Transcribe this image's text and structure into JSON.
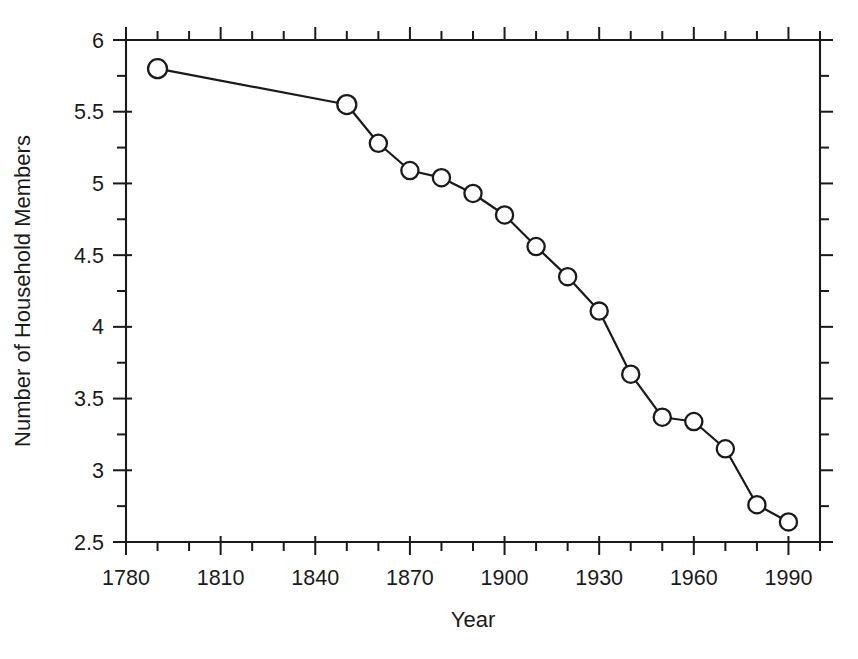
{
  "chart_data": {
    "type": "line",
    "title": "",
    "subtitle": "",
    "xlabel": "Year",
    "ylabel": "Number of Household Members",
    "xlim": [
      1780,
      2000
    ],
    "ylim": [
      2.5,
      6
    ],
    "x_major_ticks": [
      1780,
      1810,
      1840,
      1870,
      1900,
      1930,
      1960,
      1990
    ],
    "x_major_tick_labels": [
      "1780",
      "1810",
      "1840",
      "1870",
      "1900",
      "1930",
      "1960",
      "1990"
    ],
    "x_minor_tick_step": 10,
    "y_major_ticks": [
      2.5,
      3,
      3.5,
      4,
      4.5,
      5,
      5.5,
      6
    ],
    "y_major_tick_labels": [
      "2.5",
      "3",
      "3.5",
      "4",
      "4.5",
      "5",
      "5.5",
      "6"
    ],
    "y_minor_tick_step": 0.25,
    "grid": false,
    "legend": null,
    "legend_position": "none",
    "marker": "open-circle",
    "marker_face_color": "#ffffff",
    "marker_edge_color": "#1a1a1a",
    "line_color": "#1a1a1a",
    "series": [
      {
        "name": "Number of Household Members",
        "x": [
          1790,
          1850,
          1860,
          1870,
          1880,
          1890,
          1900,
          1910,
          1920,
          1930,
          1940,
          1950,
          1960,
          1970,
          1980,
          1990
        ],
        "values": [
          5.8,
          5.55,
          5.28,
          5.09,
          5.04,
          4.93,
          4.78,
          4.56,
          4.35,
          4.11,
          3.67,
          3.37,
          3.34,
          3.15,
          2.76,
          2.64
        ]
      }
    ]
  },
  "axes": {
    "x_title": "Year",
    "y_title": "Number of Household Members"
  },
  "colors": {
    "foreground": "#1a1a1a",
    "background": "#ffffff",
    "marker_fill": "#ffffff"
  }
}
